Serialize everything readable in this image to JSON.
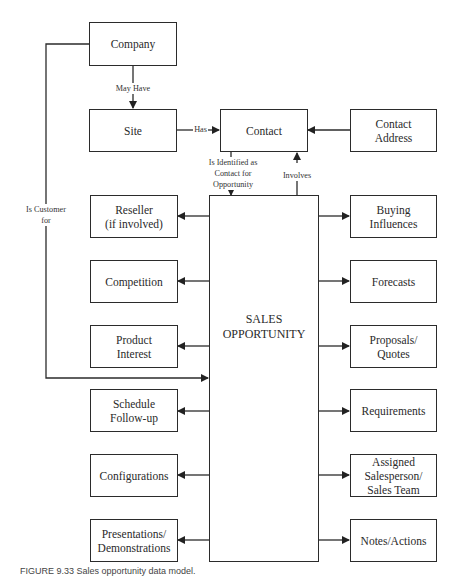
{
  "boxes": {
    "company": "Company",
    "site": "Site",
    "contact": "Contact",
    "contact_address": "Contact\nAddress",
    "sales_opportunity": "SALES\nOPPORTUNITY",
    "left": [
      "Reseller\n(if involved)",
      "Competition",
      "Product\nInterest",
      "Schedule\nFollow-up",
      "Configurations",
      "Presentations/\nDemonstrations"
    ],
    "right": [
      "Buying\nInfluences",
      "Forecasts",
      "Proposals/\nQuotes",
      "Requirements",
      "Assigned\nSalesperson/\nSales Team",
      "Notes/Actions"
    ]
  },
  "relationships": {
    "company_site": "May Have",
    "site_contact": "Has",
    "contact_opportunity": "Is Identified as\nContact for\nOpportunity",
    "opportunity_contact": "Involves",
    "company_opportunity": "Is Customer\nfor"
  },
  "caption": "FIGURE 9.33   Sales opportunity data model."
}
